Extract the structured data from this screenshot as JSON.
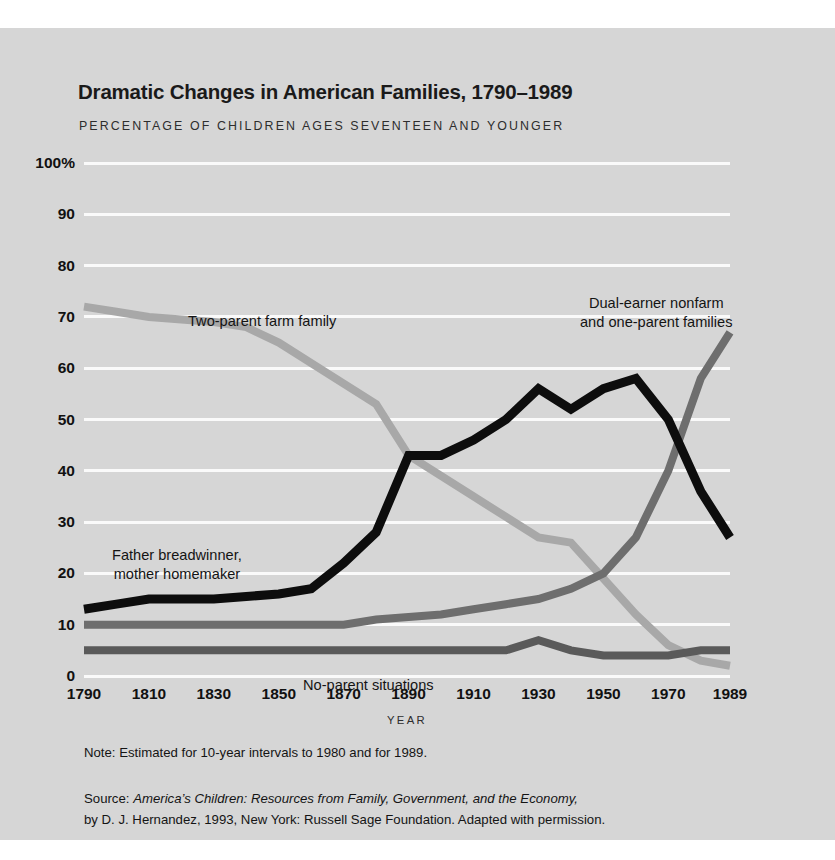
{
  "title": "Dramatic Changes in American Families, 1790–1989",
  "subtitle": "PERCENTAGE OF CHILDREN AGES SEVENTEEN AND YOUNGER",
  "note": "Note: Estimated for 10-year intervals to 1980 and for 1989.",
  "source": {
    "prefix": "Source: ",
    "italic_title": "America’s Children: Resources from Family, Government, and the Economy,",
    "rest": "by D. J. Hernandez, 1993, New York: Russell Sage Foundation. Adapted with permission."
  },
  "annotations": {
    "farm": "Two-parent farm family",
    "dual_line1": "Dual-earner nonfarm",
    "dual_line2": "and one-parent families",
    "father_line1": "Father breadwinner,",
    "father_line2": "mother homemaker",
    "noparent": "No-parent situations"
  },
  "colors": {
    "background": "#d6d6d6",
    "page": "#ffffff",
    "gridline": "#fafafa",
    "text": "#141414",
    "farm": "#a8a8a8",
    "father": "#0d0d0d",
    "dual": "#6e6e6e",
    "noparent": "#5a5a5a"
  },
  "chart_data": {
    "type": "line",
    "title": "Dramatic Changes in American Families, 1790–1989",
    "subtitle": "PERCENTAGE OF CHILDREN AGES SEVENTEEN AND YOUNGER",
    "xlabel": "YEAR",
    "ylabel": "",
    "xlim": [
      1790,
      1989
    ],
    "ylim": [
      0,
      100
    ],
    "grid": true,
    "legend_position": "inline-annotations",
    "ytick_labels": [
      "0",
      "10",
      "20",
      "30",
      "40",
      "50",
      "60",
      "70",
      "80",
      "90",
      "100%"
    ],
    "ytick_values": [
      0,
      10,
      20,
      30,
      40,
      50,
      60,
      70,
      80,
      90,
      100
    ],
    "xtick_labels": [
      "1790",
      "1810",
      "1830",
      "1850",
      "1870",
      "1890",
      "1910",
      "1930",
      "1950",
      "1970",
      "1989"
    ],
    "xtick_values": [
      1790,
      1810,
      1830,
      1850,
      1870,
      1890,
      1910,
      1930,
      1950,
      1970,
      1989
    ],
    "x": [
      1790,
      1800,
      1810,
      1820,
      1830,
      1840,
      1850,
      1860,
      1870,
      1880,
      1890,
      1900,
      1910,
      1920,
      1930,
      1940,
      1950,
      1960,
      1970,
      1980,
      1989
    ],
    "series": [
      {
        "name": "Two-parent farm family",
        "color": "#a8a8a8",
        "values": [
          72,
          71,
          70,
          69.5,
          69,
          68,
          65,
          61,
          57,
          53,
          43,
          39,
          35,
          31,
          27,
          26,
          19,
          12,
          6,
          3,
          2
        ]
      },
      {
        "name": "Father breadwinner, mother homemaker",
        "color": "#0d0d0d",
        "values": [
          13,
          14,
          15,
          15,
          15,
          15.5,
          16,
          17,
          22,
          28,
          43,
          43,
          46,
          50,
          56,
          52,
          56,
          58,
          50,
          36,
          27
        ]
      },
      {
        "name": "Dual-earner nonfarm and one-parent families",
        "color": "#6e6e6e",
        "values": [
          10,
          10,
          10,
          10,
          10,
          10,
          10,
          10,
          10,
          11,
          11.5,
          12,
          13,
          14,
          15,
          17,
          20,
          27,
          40,
          58,
          67
        ]
      },
      {
        "name": "No-parent situations",
        "color": "#5a5a5a",
        "values": [
          5,
          5,
          5,
          5,
          5,
          5,
          5,
          5,
          5,
          5,
          5,
          5,
          5,
          5,
          7,
          5,
          4,
          4,
          4,
          5,
          5
        ]
      }
    ]
  }
}
